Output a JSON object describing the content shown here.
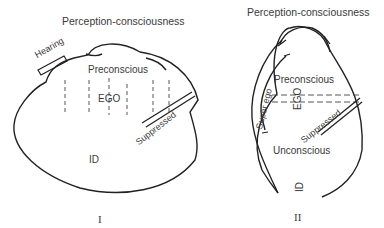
{
  "diagram_1": {
    "title": "Perception-consciousness",
    "labels": {
      "hearing": "Hearing",
      "preconscious": "Preconscious",
      "ego": "EGO",
      "suppressed": "Suppressed",
      "id": "ID"
    },
    "numeral": "I"
  },
  "diagram_2": {
    "title": "Perception-consciousness",
    "labels": {
      "preconscious": "Preconscious",
      "ego": "EGO",
      "super_ego": "Super ego",
      "suppressed": "Suppressed",
      "unconscious": "Unconscious",
      "id": "ID"
    },
    "numeral": "II"
  }
}
